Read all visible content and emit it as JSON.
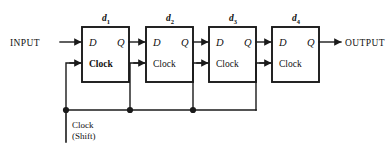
{
  "diagram": {
    "colors": {
      "line": "#1a1a1a",
      "box_fill": "#ffffff",
      "background": "#ffffff",
      "text": "#111111"
    },
    "input_label": "INPUT",
    "output_label": "OUTPUT",
    "bus_label_line1": "Clock",
    "bus_label_line2": "(Shift)",
    "stages": [
      {
        "id": "d1",
        "label_base": "d",
        "label_sub": "1",
        "d_pin": "D",
        "q_pin": "Q",
        "clock_pin": "Clock"
      },
      {
        "id": "d2",
        "label_base": "d",
        "label_sub": "2",
        "d_pin": "D",
        "q_pin": "Q",
        "clock_pin": "Clock"
      },
      {
        "id": "d3",
        "label_base": "d",
        "label_sub": "3",
        "d_pin": "D",
        "q_pin": "Q",
        "clock_pin": "Clock"
      },
      {
        "id": "d4",
        "label_base": "d",
        "label_sub": "4",
        "d_pin": "D",
        "q_pin": "Q",
        "clock_pin": "Clock"
      }
    ]
  }
}
